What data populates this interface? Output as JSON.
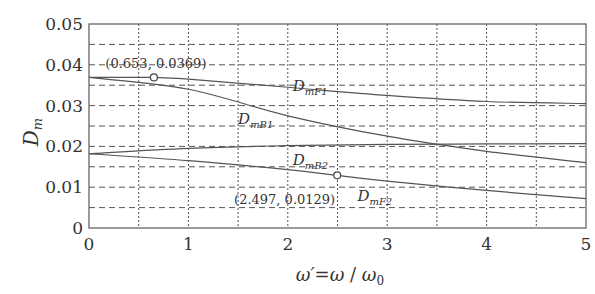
{
  "chart_data": {
    "type": "line",
    "title": "",
    "xlabel": "ω′=ω/ω₀",
    "ylabel": "D_m",
    "xlim": [
      0,
      5
    ],
    "ylim": [
      0,
      0.05
    ],
    "xticks": [
      "0",
      "1",
      "2",
      "3",
      "4",
      "5"
    ],
    "yticks": [
      "0",
      "0.01",
      "0.02",
      "0.03",
      "0.04",
      "0.05"
    ],
    "grid": true,
    "series": [
      {
        "name": "D_mF1",
        "main": "D",
        "sub": "mF1",
        "x": [
          0,
          0.653,
          1,
          2,
          3,
          4,
          5
        ],
        "y": [
          0.0369,
          0.0369,
          0.0365,
          0.0345,
          0.0325,
          0.031,
          0.0305
        ]
      },
      {
        "name": "D_mB1",
        "main": "D",
        "sub": "mB1",
        "x": [
          0,
          1,
          2,
          3,
          4,
          5
        ],
        "y": [
          0.0369,
          0.034,
          0.0275,
          0.0225,
          0.0188,
          0.016
        ]
      },
      {
        "name": "D_mB2",
        "main": "D",
        "sub": "mB2",
        "x": [
          0,
          1,
          2,
          3,
          4,
          5
        ],
        "y": [
          0.0182,
          0.0195,
          0.0202,
          0.0205,
          0.0206,
          0.0207
        ]
      },
      {
        "name": "D_mF2",
        "main": "D",
        "sub": "mF2",
        "x": [
          0,
          1,
          2,
          2.497,
          3,
          4,
          5
        ],
        "y": [
          0.0182,
          0.0165,
          0.0143,
          0.0129,
          0.0115,
          0.0092,
          0.0072
        ]
      }
    ],
    "annotations": [
      {
        "text": "(0.653, 0.0369)",
        "x": 0.653,
        "y": 0.0369
      },
      {
        "text": "(2.497, 0.0129)",
        "x": 2.497,
        "y": 0.0129
      }
    ],
    "series_labels": [
      {
        "series": "D_mF1",
        "x": 2.05,
        "y": 0.0335
      },
      {
        "series": "D_mB1",
        "x": 1.5,
        "y": 0.0255
      },
      {
        "series": "D_mB2",
        "x": 2.05,
        "y": 0.0155
      },
      {
        "series": "D_mF2",
        "x": 2.7,
        "y": 0.0065
      }
    ]
  }
}
